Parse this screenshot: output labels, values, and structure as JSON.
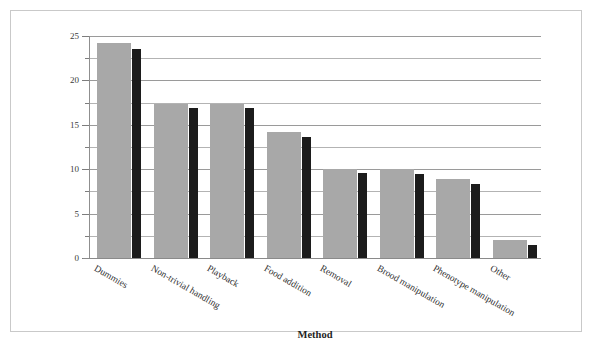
{
  "chart_data": {
    "type": "bar",
    "title": "",
    "xlabel": "Method",
    "ylabel": "Percentage of papers",
    "ylim": [
      0,
      25
    ],
    "ytick_labels": [
      "0",
      "5",
      "10",
      "15",
      "20",
      "25"
    ],
    "ytick_values": [
      0,
      5,
      10,
      15,
      20,
      25
    ],
    "minor_tick_step": 2.5,
    "grid": "horizontal",
    "legend": "none",
    "categories": [
      "Dummies",
      "Non-trivial handling",
      "Playback",
      "Food addition",
      "Removal",
      "Brood manipulation",
      "Phenotype manipulation",
      "Other"
    ],
    "series": [
      {
        "name": "series-light",
        "color": "#a8a8a8",
        "values": [
          24.2,
          17.3,
          17.3,
          14.2,
          10.0,
          10.0,
          8.9,
          2.0
        ]
      },
      {
        "name": "series-dark",
        "color": "#1c1c1c",
        "values": [
          23.5,
          16.9,
          16.9,
          13.6,
          9.6,
          9.5,
          8.3,
          1.5
        ]
      }
    ]
  },
  "figure": {
    "border_color": "#c9c9c9",
    "background": "#ffffff"
  }
}
